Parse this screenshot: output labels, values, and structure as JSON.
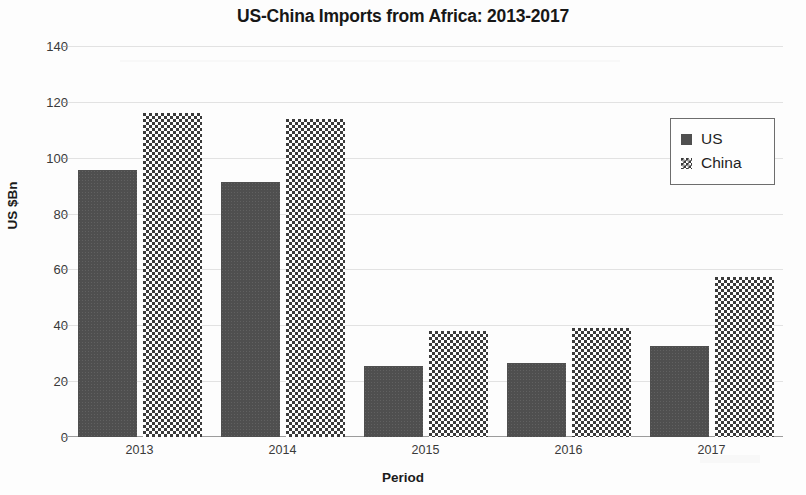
{
  "chart_data": {
    "type": "bar",
    "title": "US-China Imports from Africa: 2013-2017",
    "xlabel": "Period",
    "ylabel": "US $Bn",
    "categories": [
      "2013",
      "2014",
      "2015",
      "2016",
      "2017"
    ],
    "series": [
      {
        "name": "US",
        "color": "#4f4f4f",
        "pattern": "solid",
        "values": [
          95.6,
          91.4,
          25.3,
          26.4,
          32.5
        ]
      },
      {
        "name": "China",
        "color": "#3b3b3b",
        "pattern": "checked",
        "values": [
          116.0,
          114.0,
          38.0,
          39.0,
          57.3
        ]
      }
    ],
    "ylim": [
      0,
      140
    ],
    "yticks": [
      0,
      20,
      40,
      60,
      80,
      100,
      120,
      140
    ],
    "ytick_labels": [
      "0",
      "20",
      "40",
      "60",
      "80",
      "100",
      "120",
      "140"
    ],
    "grid": true,
    "grid_axis": "y",
    "legend_position": "top-right",
    "legend_entries": [
      "US",
      "China"
    ]
  }
}
